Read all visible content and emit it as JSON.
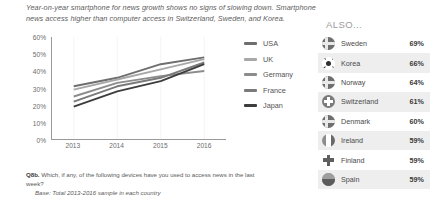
{
  "headline": "Year-on-year smartphone for news growth shows no signs of slowing down. Smartphone news access higher than computer access in Switzerland, Sweden, and Korea.",
  "also_heading": "ALSO...",
  "footnote": {
    "question_label": "Q8b.",
    "question": "Which, if any, of the following devices have you used to access news in the last week?",
    "base": "Base: Total 2013-2016 sample in each country"
  },
  "chart_data": {
    "type": "line",
    "title": "",
    "xlabel": "",
    "ylabel": "",
    "x": [
      "2013",
      "2014",
      "2015",
      "2016"
    ],
    "ylim": [
      0,
      60
    ],
    "yticks": [
      "0%",
      "10%",
      "20%",
      "30%",
      "40%",
      "50%",
      "60%"
    ],
    "ytick_values": [
      0,
      10,
      20,
      30,
      40,
      50,
      60
    ],
    "grid": true,
    "legend_position": "right",
    "series": [
      {
        "name": "USA",
        "values": [
          31,
          36,
          44,
          48
        ],
        "color": "#6e6e6e"
      },
      {
        "name": "UK",
        "values": [
          29,
          35,
          41,
          47
        ],
        "color": "#a8a8a8"
      },
      {
        "name": "Germany",
        "values": [
          25,
          33,
          37,
          40
        ],
        "color": "#8c8c8c"
      },
      {
        "name": "France",
        "values": [
          22,
          31,
          36,
          45
        ],
        "color": "#7a7a7a"
      },
      {
        "name": "Japan",
        "values": [
          19,
          28,
          34,
          44
        ],
        "color": "#3d3d3d"
      }
    ]
  },
  "countries": {
    "columns": [
      "flag",
      "name",
      "value"
    ],
    "rows": [
      {
        "name": "Sweden",
        "value": "69%",
        "flag": "sweden-flag-icon"
      },
      {
        "name": "Korea",
        "value": "66%",
        "flag": "korea-flag-icon"
      },
      {
        "name": "Norway",
        "value": "64%",
        "flag": "norway-flag-icon"
      },
      {
        "name": "Switzerland",
        "value": "61%",
        "flag": "switzerland-flag-icon"
      },
      {
        "name": "Denmark",
        "value": "60%",
        "flag": "denmark-flag-icon"
      },
      {
        "name": "Ireland",
        "value": "59%",
        "flag": "ireland-flag-icon"
      },
      {
        "name": "Finland",
        "value": "59%",
        "flag": "finland-flag-icon"
      },
      {
        "name": "Spain",
        "value": "59%",
        "flag": "spain-flag-icon"
      }
    ]
  }
}
